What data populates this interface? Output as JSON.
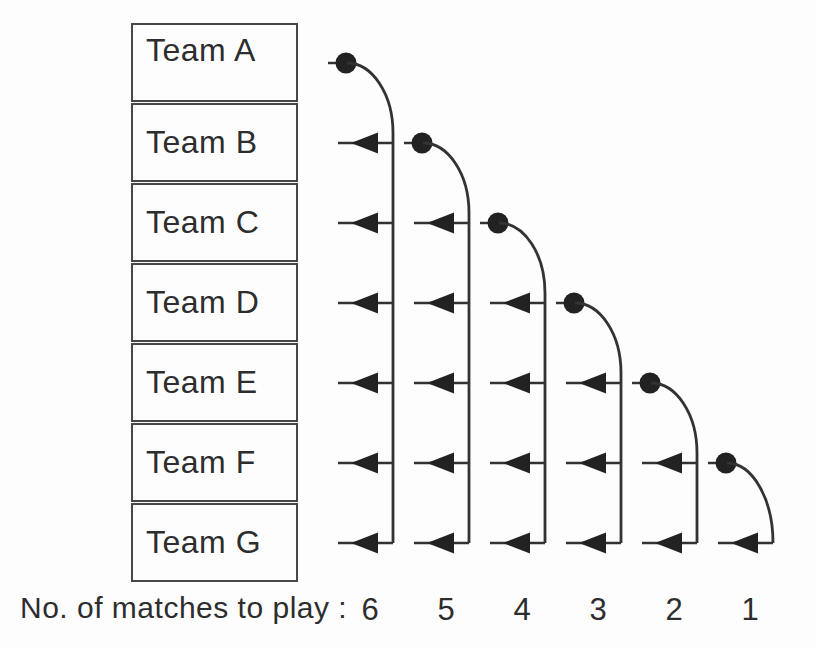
{
  "table": {
    "teams": [
      "Team A",
      "Team B",
      "Team C",
      "Team D",
      "Team E",
      "Team F",
      "Team G"
    ]
  },
  "diagram": {
    "columns": [
      {
        "team": "Team A",
        "matches": 6
      },
      {
        "team": "Team B",
        "matches": 5
      },
      {
        "team": "Team C",
        "matches": 4
      },
      {
        "team": "Team D",
        "matches": 3
      },
      {
        "team": "Team E",
        "matches": 2
      },
      {
        "team": "Team F",
        "matches": 1
      }
    ],
    "dot_color": "#222222",
    "line_color": "#333333"
  },
  "footer": {
    "label": "No. of matches to play :",
    "counts": [
      "6",
      "5",
      "4",
      "3",
      "2",
      "1"
    ]
  },
  "colors": {
    "background": "#fdfdfd",
    "ink": "#2d2d2d",
    "cell_border": "#474747"
  }
}
